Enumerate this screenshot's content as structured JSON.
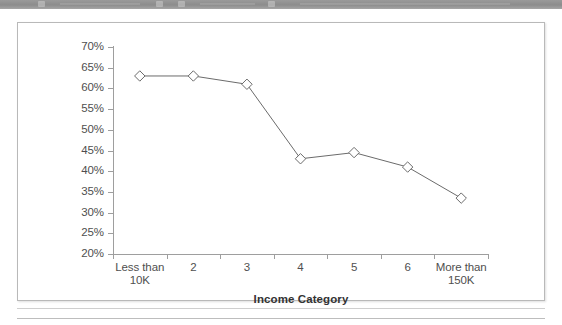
{
  "toolbar": {
    "name": "cropped-toolbar-strip",
    "background_color": "#8c8c8c"
  },
  "figure": {
    "border_color": "#b9b9b9",
    "background_color": "#ffffff"
  },
  "chart_data": {
    "type": "line",
    "title": "",
    "subtitle": "",
    "xlabel": "Income Category",
    "ylabel": "",
    "categories": [
      "Less than 10K",
      "2",
      "3",
      "4",
      "5",
      "6",
      "More than 150K"
    ],
    "category_lines": [
      [
        "Less than",
        "10K"
      ],
      [
        "2",
        ""
      ],
      [
        "3",
        ""
      ],
      [
        "4",
        ""
      ],
      [
        "5",
        ""
      ],
      [
        "6",
        ""
      ],
      [
        "More than",
        "150K"
      ]
    ],
    "values": [
      63,
      63,
      61,
      43,
      44.5,
      41,
      33.5
    ],
    "value_labels": [
      "63%",
      "63%",
      "61%",
      "43%",
      "44.5%",
      "41%",
      "33.5%"
    ],
    "ylim": [
      20,
      70
    ],
    "ytick_step": 5,
    "ytick_labels": [
      "70%",
      "65%",
      "60%",
      "55%",
      "50%",
      "45%",
      "40%",
      "35%",
      "30%",
      "25%",
      "20%"
    ],
    "ytick_values": [
      70,
      65,
      60,
      55,
      50,
      45,
      40,
      35,
      30,
      25,
      20
    ],
    "grid": false,
    "legend": false,
    "legend_position": "none",
    "series": [
      {
        "name": "Income Category Series",
        "values": [
          63,
          63,
          61,
          43,
          44.5,
          41,
          33.5
        ],
        "marker": "diamond-open",
        "marker_color": "#ffffff",
        "line_color": "#6b6b6b",
        "marker_edge_color": "#6b6b6b"
      }
    ],
    "colors": {
      "line": "#6b6b6b",
      "axis": "#9e9e9e",
      "text": "#4f4f4f",
      "axis_title": "#333333"
    }
  }
}
